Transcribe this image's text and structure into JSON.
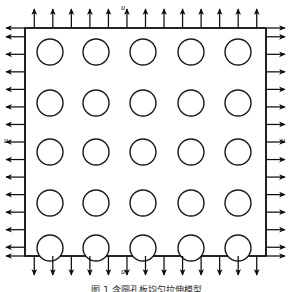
{
  "figure": {
    "caption": "图 1  含圆孔板均匀拉伸模型",
    "canvas": {
      "width": 293,
      "height": 292
    }
  },
  "plate": {
    "name": "perforated-plate",
    "x": 25,
    "y": 28,
    "width": 241,
    "height": 228,
    "stroke_color": "#1a1a1a",
    "stroke_width": 1.6,
    "fill_color": "#ffffff"
  },
  "holes": {
    "rows": 5,
    "cols": 5,
    "count": 25,
    "radius": 13,
    "stroke_color": "#1a1a1a",
    "stroke_width": 1.4,
    "fill_color": "#ffffff",
    "centers_x": [
      50,
      96,
      143,
      191,
      238
    ],
    "centers_y": [
      52,
      103,
      152,
      203,
      248
    ]
  },
  "loads": {
    "symbol": "u",
    "arrow_color": "#0d0d0d",
    "arrow_count_per_edge": 13,
    "edges": [
      {
        "id": "top",
        "label": "u",
        "direction": "up",
        "arrow_count": 13
      },
      {
        "id": "bottom",
        "label": "u",
        "direction": "down",
        "arrow_count": 13
      },
      {
        "id": "left",
        "label": "u",
        "direction": "left",
        "arrow_count": 13
      },
      {
        "id": "right",
        "label": "u",
        "direction": "right",
        "arrow_count": 13
      }
    ],
    "corner_arrows": [
      {
        "id": "top-left",
        "direction": "left"
      },
      {
        "id": "top-right",
        "direction": "right"
      },
      {
        "id": "bottom-left",
        "direction": "left"
      },
      {
        "id": "bottom-right",
        "direction": "right"
      }
    ]
  }
}
